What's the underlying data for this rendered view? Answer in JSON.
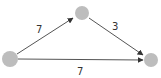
{
  "diagram": {
    "type": "directed-weighted-graph",
    "node_color": "#bdbdbd",
    "edge_color": "#555555",
    "label_color": "#333333",
    "nodes": [
      {
        "id": "A",
        "x": 10,
        "y": 59,
        "r": 8
      },
      {
        "id": "B",
        "x": 82,
        "y": 13,
        "r": 7
      },
      {
        "id": "C",
        "x": 151,
        "y": 60,
        "r": 7
      }
    ],
    "edges": [
      {
        "from": "A",
        "to": "B",
        "weight": "7"
      },
      {
        "from": "B",
        "to": "C",
        "weight": "3"
      },
      {
        "from": "A",
        "to": "C",
        "weight": "7"
      }
    ]
  }
}
